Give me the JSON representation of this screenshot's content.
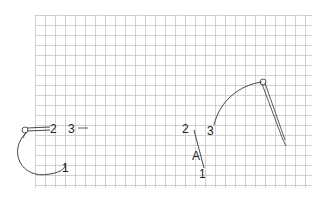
{
  "figure": {
    "grid": {
      "x0": 35,
      "y0": 15,
      "x1": 312,
      "y1": 188,
      "cell": 10,
      "line_color": "#bdbdbd"
    },
    "left_diagram": {
      "labels": {
        "p1": "1",
        "p2": "2",
        "p3": "3"
      }
    },
    "right_diagram": {
      "labels": {
        "p1": "1",
        "p2": "2",
        "p3": "3",
        "segment": "A"
      }
    },
    "stroke_color": "#333333"
  }
}
